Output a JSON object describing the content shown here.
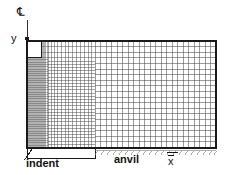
{
  "figure": {
    "type": "finite-element-mesh-diagram",
    "background_color": "#ffffff",
    "line_color": "#3a3a3a",
    "label_color": "#111111"
  },
  "labels": {
    "centerline": "℄",
    "y_axis": "y",
    "x_axis": "x",
    "x_axis_overbar": true,
    "indent": "indent",
    "anvil": "anvil"
  },
  "geometry": {
    "mesh_left": 27,
    "mesh_right": 216,
    "mesh_top": 41,
    "mesh_bottom_indent": 148,
    "mesh_bottom_anvil": 148,
    "indent_region_right": 95,
    "fine_zone_right": 48,
    "transition_zone_right": 95,
    "notch_top": 57,
    "notch_right": 41
  },
  "mesh_data": {
    "coarse_columns": 34,
    "coarse_rows": 19,
    "fine_columns": 22,
    "fine_rows": 40,
    "transition_columns": 14,
    "graded_refinement": true
  },
  "axes": {
    "y_arrow": {
      "x": 27,
      "y_top": 29,
      "y_bottom": 44
    },
    "centerline_tick": {
      "x": 27,
      "y_top": 20,
      "y_bottom": 30
    }
  },
  "leader_lines": {
    "indent_leader": {
      "x1": 24,
      "y1": 158,
      "x2": 34,
      "y2": 146
    },
    "indent_bracket": {
      "x1": 10,
      "y1": 168,
      "x2": 95,
      "y2": 150
    }
  }
}
